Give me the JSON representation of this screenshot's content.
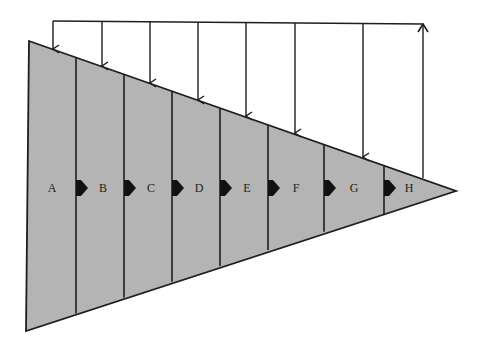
{
  "diagram": {
    "type": "sequential funnel / wedge with feedback arrows",
    "colors": {
      "fill": "#b4b4b4",
      "stroke": "#1e1e1e",
      "background": "#ffffff"
    },
    "segments": [
      {
        "label": "A"
      },
      {
        "label": "B"
      },
      {
        "label": "C"
      },
      {
        "label": "D"
      },
      {
        "label": "E"
      },
      {
        "label": "F"
      },
      {
        "label": "G"
      },
      {
        "label": "H"
      }
    ],
    "flow_arrows_count": 7,
    "feedback": {
      "return_arrow": "upward arrow from wedge tip region to top bus line",
      "down_arrows_count": 7
    }
  }
}
